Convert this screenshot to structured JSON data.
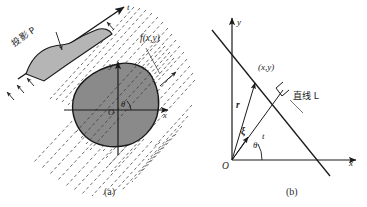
{
  "figure": {
    "title_caption_a": "(a)",
    "title_caption_b": "(b)",
    "panels": [
      {
        "id": "a",
        "caption": "(a)",
        "description": "Parallel-beam projection of a 2-D object f(x,y) onto the t axis at angle theta",
        "labels": {
          "projection": "投影 P",
          "t_axis": "t",
          "object_function": "f(x,y)",
          "y_axis": "y",
          "x_axis": "x",
          "origin": "O",
          "angle": "θ"
        }
      },
      {
        "id": "b",
        "caption": "(b)",
        "description": "Geometry of the line L in the x-y plane with polar parameters",
        "labels": {
          "y_axis": "y",
          "x_axis": "x",
          "point": "(x,y)",
          "radius": "r",
          "xi": "ξ",
          "t_distance": "t",
          "angle": "θ",
          "origin": "O",
          "line_name": "直线 L"
        }
      }
    ],
    "colors": {
      "stroke": "#1a1a1a",
      "object_fill": "#8a8a8a",
      "projection_fill": "#b5b5b5",
      "ray_stroke": "#4a4a4a",
      "text": "#1a1a1a"
    }
  }
}
